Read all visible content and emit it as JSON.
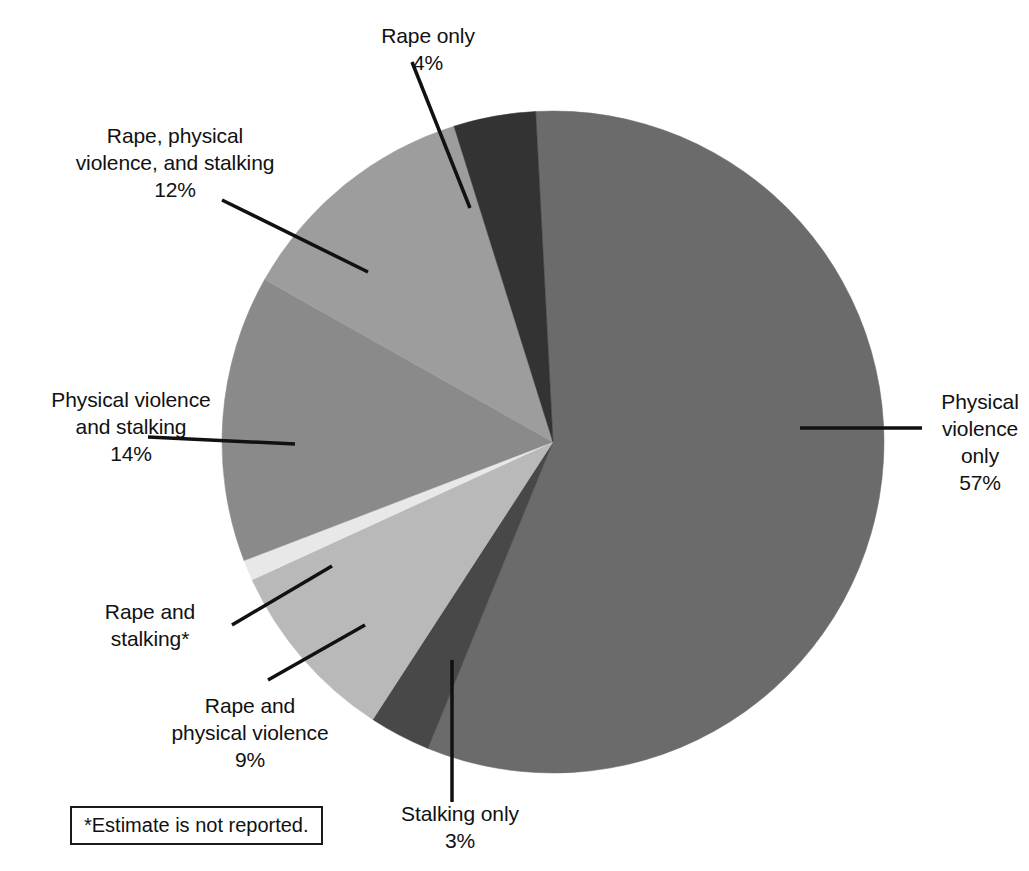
{
  "chart_data": {
    "type": "pie",
    "title": "",
    "subtitle": "",
    "legend_position": "callout-labels",
    "center": {
      "x": 553,
      "y": 442
    },
    "radius": 331,
    "start_angle_deg": -3,
    "footnote": "*Estimate is not reported.",
    "categories": [
      "Physical violence only",
      "Stalking only",
      "Rape and physical violence",
      "Rape and stalking*",
      "Physical violence and stalking",
      "Rape, physical violence, and stalking",
      "Rape only"
    ],
    "values": [
      57,
      3,
      9,
      1,
      14,
      12,
      4
    ],
    "value_labels": [
      "57%",
      "3%",
      "9%",
      "",
      "14%",
      "12%",
      "4%"
    ],
    "colors": [
      "#6b6b6b",
      "#484848",
      "#b9b9b9",
      "#e8e8e8",
      "#8a8a8a",
      "#9d9d9d",
      "#333333"
    ],
    "slices": [
      {
        "id": "physical-violence-only",
        "name": "Physical violence only",
        "value": 57,
        "value_label": "57%",
        "color": "#6b6b6b",
        "label_lines": [
          "Physical",
          "violence",
          "only",
          "57%"
        ]
      },
      {
        "id": "stalking-only",
        "name": "Stalking only",
        "value": 3,
        "value_label": "3%",
        "color": "#484848",
        "label_lines": [
          "Stalking only",
          "3%"
        ]
      },
      {
        "id": "rape-and-physical-violence",
        "name": "Rape and physical violence",
        "value": 9,
        "value_label": "9%",
        "color": "#b9b9b9",
        "label_lines": [
          "Rape and",
          "physical violence",
          "9%"
        ]
      },
      {
        "id": "rape-and-stalking",
        "name": "Rape and stalking*",
        "value": 1,
        "value_label": "",
        "color": "#e8e8e8",
        "label_lines": [
          "Rape and",
          "stalking*"
        ]
      },
      {
        "id": "physical-violence-and-stalking",
        "name": "Physical violence and stalking",
        "value": 14,
        "value_label": "14%",
        "color": "#8a8a8a",
        "label_lines": [
          "Physical violence",
          "and stalking",
          "14%"
        ]
      },
      {
        "id": "rape-physical-violence-and-stalking",
        "name": "Rape, physical violence, and stalking",
        "value": 12,
        "value_label": "12%",
        "color": "#9d9d9d",
        "label_lines": [
          "Rape, physical",
          "violence, and stalking",
          "12%"
        ]
      },
      {
        "id": "rape-only",
        "name": "Rape only",
        "value": 4,
        "value_label": "4%",
        "color": "#333333",
        "label_lines": [
          "Rape only",
          "4%"
        ]
      }
    ]
  },
  "labels": {
    "rape_only": "Rape only\n4%",
    "rape_physical_violence_stalking": "Rape, physical\nviolence, and stalking\n12%",
    "physical_violence_and_stalking": "Physical violence\nand stalking\n14%",
    "rape_and_stalking": "Rape and\nstalking*",
    "rape_and_physical_violence": "Rape and\nphysical violence\n9%",
    "stalking_only": "Stalking only\n3%",
    "physical_violence_only": "Physical\nviolence\nonly\n57%"
  },
  "footnote": {
    "text": "*Estimate is not reported."
  },
  "colors": {
    "background": "#ffffff",
    "text": "#111111",
    "leader_line": "#111111",
    "footnote_border": "#1a1a1a"
  }
}
